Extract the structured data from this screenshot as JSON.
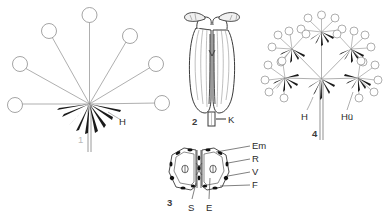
{
  "plate": {
    "title": "Apiaceae inflorescence and fruit plate",
    "background_color": "#ffffff",
    "ink_color": "#2b2b2b",
    "light_ink_color": "#9a9a9a"
  },
  "figures": [
    {
      "number": "1",
      "name": "simple-umbel-diagram",
      "caption": "Simple umbel with involucral bracts",
      "labels": [
        {
          "key": "H",
          "text": "H",
          "meaning": "Hülle (involucre)"
        }
      ],
      "ray_count": 8,
      "flower_head_count": 8
    },
    {
      "number": "2",
      "name": "anther-diagram",
      "caption": "Anther with filament",
      "labels": [
        {
          "key": "K",
          "text": "K",
          "meaning": "Konnektiv / filament"
        }
      ]
    },
    {
      "number": "3",
      "name": "fruit-cross-section",
      "caption": "Transverse section of schizocarp with two mericarps",
      "labels": [
        {
          "key": "Em",
          "text": "Em",
          "meaning": "Embryo"
        },
        {
          "key": "R",
          "text": "R",
          "meaning": "Riefe (rib)"
        },
        {
          "key": "V",
          "text": "V",
          "meaning": "Vitta (oil duct)"
        },
        {
          "key": "F",
          "text": "F",
          "meaning": "Fugenfläche"
        },
        {
          "key": "S",
          "text": "S",
          "meaning": "Samen (seed)"
        },
        {
          "key": "E",
          "text": "E",
          "meaning": "Endosperm"
        }
      ],
      "mericarp_count": 2
    },
    {
      "number": "4",
      "name": "compound-umbel-diagram",
      "caption": "Compound umbel with involucre and involucels",
      "labels": [
        {
          "key": "H",
          "text": "H",
          "meaning": "Hülle (involucre)"
        },
        {
          "key": "Hue",
          "text": "Hü",
          "meaning": "Hüllchen (involucel)"
        }
      ],
      "umbellet_count": 5
    }
  ]
}
